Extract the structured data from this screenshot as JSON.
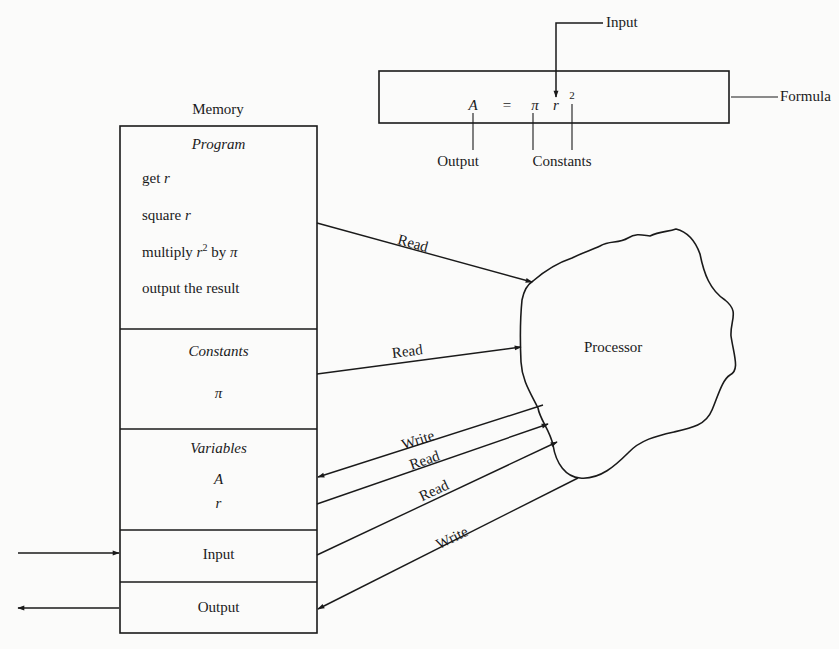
{
  "formula": {
    "label": "Formula",
    "lhs": "A",
    "equals": "=",
    "pi": "π",
    "var": "r",
    "exponent": "2",
    "input_label": "Input",
    "output_label": "Output",
    "constants_label": "Constants"
  },
  "memory": {
    "title": "Memory",
    "sections": {
      "program": {
        "title": "Program",
        "steps": [
          {
            "text": "get ",
            "var": "r"
          },
          {
            "text": "square ",
            "var": "r"
          },
          {
            "text": "multiply ",
            "var": "r",
            "sup": "2",
            "tail": " by ",
            "tail_sym": "π"
          },
          {
            "text": "output the result"
          }
        ]
      },
      "constants": {
        "title": "Constants",
        "items": [
          "π"
        ]
      },
      "variables": {
        "title": "Variables",
        "items": [
          "A",
          "r"
        ]
      },
      "input": {
        "title": "Input"
      },
      "output": {
        "title": "Output"
      }
    }
  },
  "processor": {
    "label": "Processor"
  },
  "connections": [
    {
      "from": "program",
      "to": "processor",
      "label": "Read"
    },
    {
      "from": "constants",
      "to": "processor",
      "label": "Read"
    },
    {
      "from": "processor",
      "to": "variables",
      "label": "Write"
    },
    {
      "from": "variables",
      "to": "processor",
      "label": "Read"
    },
    {
      "from": "input",
      "to": "processor",
      "label": "Read"
    },
    {
      "from": "processor",
      "to": "output",
      "label": "Write"
    }
  ],
  "colors": {
    "ink": "#1a1a1a",
    "paper": "#fbfbfa"
  }
}
